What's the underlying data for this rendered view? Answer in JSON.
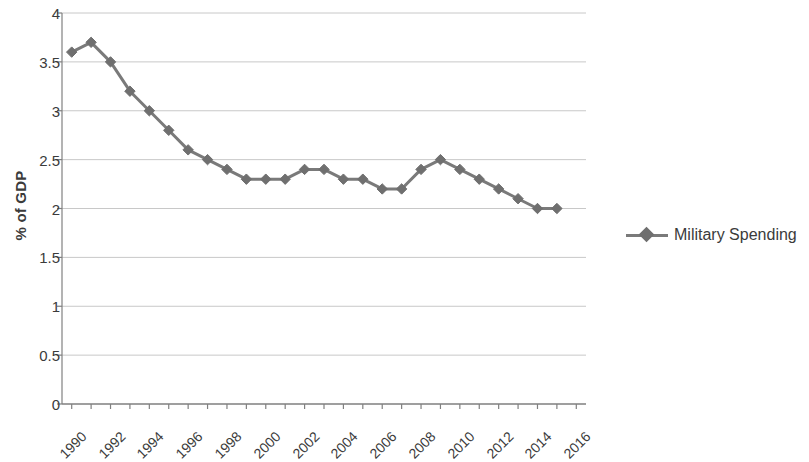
{
  "chart_data": {
    "type": "line",
    "title": "",
    "xlabel": "",
    "ylabel": "% of GDP",
    "xlim": [
      1989.5,
      2016.5
    ],
    "ylim": [
      0,
      4
    ],
    "yticks": [
      "0",
      "0.5",
      "1",
      "1.5",
      "2",
      "2.5",
      "3",
      "3.5",
      "4"
    ],
    "ytick_values": [
      0,
      0.5,
      1,
      1.5,
      2,
      2.5,
      3,
      3.5,
      4
    ],
    "xticks": [
      "1990",
      "1992",
      "1994",
      "1996",
      "1998",
      "2000",
      "2002",
      "2004",
      "2006",
      "2008",
      "2010",
      "2012",
      "2014",
      "2016"
    ],
    "xtick_values": [
      1990,
      1992,
      1994,
      1996,
      1998,
      2000,
      2002,
      2004,
      2006,
      2008,
      2010,
      2012,
      2014,
      2016
    ],
    "x": [
      1990,
      1991,
      1992,
      1993,
      1994,
      1995,
      1996,
      1997,
      1998,
      1999,
      2000,
      2001,
      2002,
      2003,
      2004,
      2005,
      2006,
      2007,
      2008,
      2009,
      2010,
      2011,
      2012,
      2013,
      2014,
      2015
    ],
    "grid": "horizontal",
    "legend_position": "right",
    "series": [
      {
        "name": "Military Spending",
        "color": "#7a7a7a",
        "marker": "diamond",
        "values": [
          3.6,
          3.7,
          3.5,
          3.2,
          3.0,
          2.8,
          2.6,
          2.5,
          2.4,
          2.3,
          2.3,
          2.3,
          2.4,
          2.4,
          2.3,
          2.3,
          2.2,
          2.2,
          2.4,
          2.5,
          2.4,
          2.3,
          2.2,
          2.1,
          2.0,
          2.0
        ]
      }
    ]
  },
  "legend": {
    "entries": [
      {
        "label": "Military Spending",
        "color": "#7a7a7a"
      }
    ]
  },
  "axis": {
    "y_title": "% of GDP",
    "line_color": "#808080",
    "grid_color": "#c8c8c8"
  }
}
